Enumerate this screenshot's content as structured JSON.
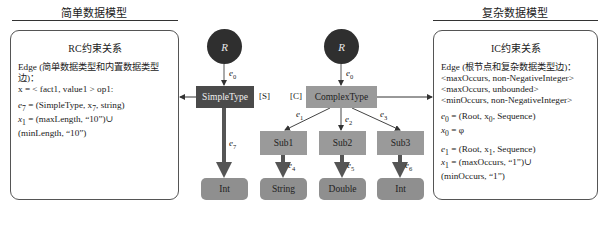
{
  "left": {
    "header": "简单数据模型",
    "panel_title": "RC约束关系",
    "lines": [
      "Edge (简单数据类型和内置数据类型边)：",
      "x = < fact1, value1 > op1:"
    ],
    "e7_def": "= (SimpleType, x",
    "e7_def_tail": ", string)",
    "x1_def": "= (maxLength, “10”)∪",
    "x1_def_2": "(minLength, “10”)"
  },
  "right": {
    "header": "复杂数据模型",
    "panel_title": "IC约束关系",
    "lines": [
      "Edge (根节点和复杂数据类型边)：",
      "<maxOccurs, non-NegativeInteger>",
      "<maxOccurs, unbounded>",
      "<minOccurs, non-NegativeInteger>"
    ],
    "e0_def": "= (Root, x",
    "e0_def_tail": ", Sequence)",
    "x0_def": "= φ",
    "e1_def": "= (Root, x",
    "e1_def_tail": ", Sequence)",
    "x1_def": "= (maxOccurs, “1”)∪",
    "x1_def_2": "(minOccurs, “1”)"
  },
  "diagram": {
    "root_left": "R",
    "root_right": "R",
    "simple_type": "SimpleType",
    "simple_tag": "[S]",
    "complex_type": "ComplexType",
    "complex_tag": "[C]",
    "subs": [
      "Sub1",
      "Sub2",
      "Sub3"
    ],
    "leaves": [
      "Int",
      "String",
      "Double",
      "Int"
    ],
    "edges": {
      "e0_left": {
        "base": "e",
        "sub": "0"
      },
      "e0_right": {
        "base": "e",
        "sub": "0"
      },
      "e1": {
        "base": "e",
        "sub": "1"
      },
      "e2": {
        "base": "e",
        "sub": "2"
      },
      "e3": {
        "base": "e",
        "sub": "3"
      },
      "e4": {
        "base": "e",
        "sub": "4"
      },
      "e5": {
        "base": "e",
        "sub": "5"
      },
      "e6": {
        "base": "e",
        "sub": "6"
      },
      "e7": {
        "base": "e",
        "sub": "7"
      }
    },
    "colors": {
      "root": "#2f2f2f",
      "simple_type": "#4a4a4a",
      "complex_type": "#9a9a9a",
      "leaf": "#8f8f8f",
      "thick_arrow": "#555555"
    }
  },
  "symbols": {
    "e": "e",
    "x": "x",
    "sub0": "0",
    "sub1": "1",
    "sub7": "7"
  }
}
